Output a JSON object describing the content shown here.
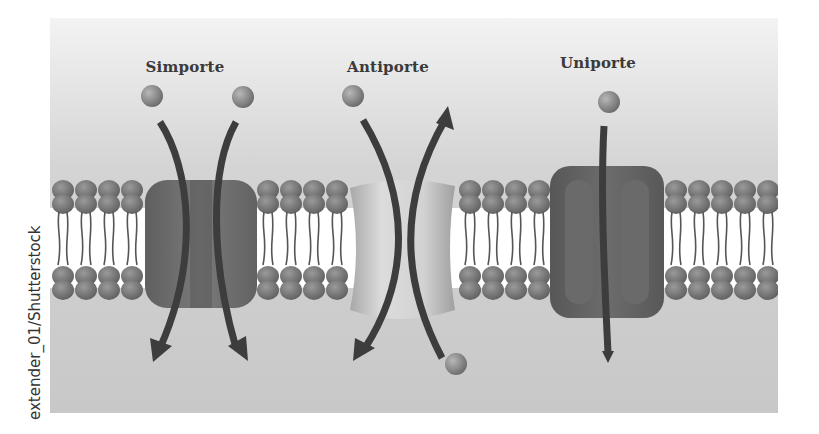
{
  "figure": {
    "labels": {
      "symport": "Simporte",
      "antiport": "Antiporte",
      "uniport": "Uniporte"
    },
    "credit": "extender_01/Shutterstock"
  },
  "colors": {
    "background_top": "#f3f3f3",
    "background_bottom": "#c8c8c8",
    "lipid_head": "#7a7a7a",
    "lipid_tail": "#555555",
    "symport_protein": "#6e6e6e",
    "antiport_protein": "#c2c2c2",
    "uniport_protein": "#5e5e5e",
    "arrow": "#3d3d3d",
    "molecule": "#8e8e8e"
  },
  "transporters": [
    {
      "type": "symport",
      "label_x": 135,
      "molecules_in": 2,
      "direction": "both inward"
    },
    {
      "type": "antiport",
      "label_x": 338,
      "molecules_in": 1,
      "molecules_out": 1,
      "direction": "opposite"
    },
    {
      "type": "uniport",
      "label_x": 548,
      "molecules_in": 1,
      "direction": "single inward"
    }
  ]
}
